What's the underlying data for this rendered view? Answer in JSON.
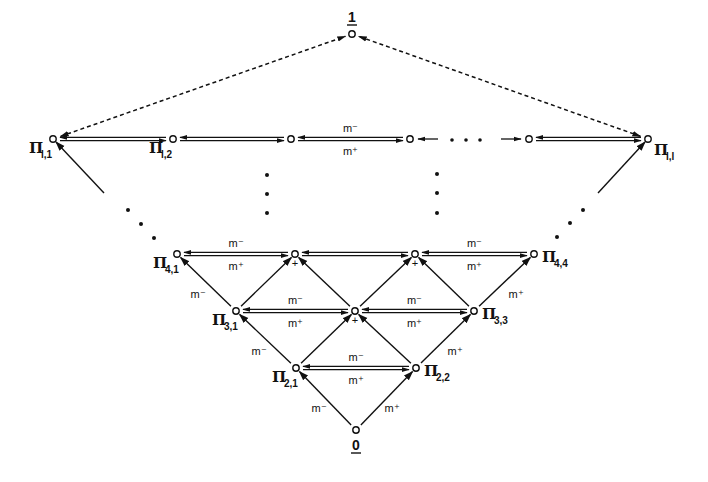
{
  "diagram": {
    "type": "lattice",
    "colors": {
      "ink": "#111111",
      "background": "#ffffff"
    },
    "top_node": {
      "id": "one",
      "label": "1",
      "x": 352,
      "y": 34
    },
    "bottom_node": {
      "id": "zero",
      "label": "0",
      "x": 356,
      "y": 430
    },
    "rows": [
      {
        "name": "row-l",
        "y": 139,
        "nodes": [
          {
            "id": "pi-l-1",
            "x": 53,
            "label": "Π",
            "sub": "l,1",
            "label_pos": "below-left"
          },
          {
            "id": "pi-l-2",
            "x": 173,
            "label": "Π",
            "sub": "l,2",
            "label_pos": "below-left"
          },
          {
            "id": "pi-l-3",
            "x": 291,
            "label": "",
            "sub": ""
          },
          {
            "id": "pi-l-4",
            "x": 410,
            "label": "",
            "sub": ""
          },
          {
            "id": "pi-l-5",
            "x": 529,
            "label": "",
            "sub": ""
          },
          {
            "id": "pi-l-l",
            "x": 648,
            "label": "Π",
            "sub": "l,l",
            "label_pos": "below-right"
          }
        ]
      },
      {
        "name": "row-4",
        "y": 254,
        "nodes": [
          {
            "id": "pi-4-1",
            "x": 177,
            "label": "Π",
            "sub": "4,1",
            "label_pos": "below-left"
          },
          {
            "id": "pi-4-2",
            "x": 295,
            "label": "",
            "sub": "",
            "plus": true
          },
          {
            "id": "pi-4-3",
            "x": 415,
            "label": "",
            "sub": "",
            "plus": true
          },
          {
            "id": "pi-4-4",
            "x": 534,
            "label": "Π",
            "sub": "4,4",
            "label_pos": "right"
          }
        ]
      },
      {
        "name": "row-3",
        "y": 311,
        "nodes": [
          {
            "id": "pi-3-1",
            "x": 236,
            "label": "Π",
            "sub": "3,1",
            "label_pos": "below-left"
          },
          {
            "id": "pi-3-2",
            "x": 355,
            "label": "",
            "sub": "",
            "plus": true
          },
          {
            "id": "pi-3-3",
            "x": 474,
            "label": "Π",
            "sub": "3,3",
            "label_pos": "right"
          }
        ]
      },
      {
        "name": "row-2",
        "y": 368,
        "nodes": [
          {
            "id": "pi-2-1",
            "x": 296,
            "label": "Π",
            "sub": "2,1",
            "label_pos": "below-left"
          },
          {
            "id": "pi-2-2",
            "x": 416,
            "label": "Π",
            "sub": "2,2",
            "label_pos": "right"
          }
        ]
      }
    ],
    "edge_labels": {
      "minus": "m⁻",
      "plus": "m⁺"
    },
    "horizontal_double_edges": [
      {
        "from": "pi-l-1",
        "to": "pi-l-2",
        "labels": false
      },
      {
        "from": "pi-l-2",
        "to": "pi-l-3",
        "labels": false
      },
      {
        "from": "pi-l-3",
        "to": "pi-l-4",
        "labels": true
      },
      {
        "from": "pi-l-5",
        "to": "pi-l-l",
        "labels": false
      },
      {
        "from": "pi-4-1",
        "to": "pi-4-2",
        "labels": true
      },
      {
        "from": "pi-4-2",
        "to": "pi-4-3",
        "labels": false
      },
      {
        "from": "pi-4-3",
        "to": "pi-4-4",
        "labels": true
      },
      {
        "from": "pi-3-1",
        "to": "pi-3-2",
        "labels": true
      },
      {
        "from": "pi-3-2",
        "to": "pi-3-3",
        "labels": true
      },
      {
        "from": "pi-2-1",
        "to": "pi-2-2",
        "labels": true
      }
    ],
    "ellipsis_row": {
      "y": 139,
      "from_x": 410,
      "to_x": 529,
      "text": "· · ·"
    },
    "diagonal_edges": [
      {
        "from": "zero",
        "to": "pi-2-1",
        "label": "m⁻",
        "label_x": 319,
        "label_y": 412
      },
      {
        "from": "zero",
        "to": "pi-2-2",
        "label": "m⁺",
        "label_x": 392,
        "label_y": 412
      },
      {
        "from": "pi-2-1",
        "to": "pi-3-1",
        "label": "m⁻",
        "label_x": 259,
        "label_y": 355
      },
      {
        "from": "pi-2-1",
        "to": "pi-3-2",
        "label": ""
      },
      {
        "from": "pi-2-2",
        "to": "pi-3-2",
        "label": ""
      },
      {
        "from": "pi-2-2",
        "to": "pi-3-3",
        "label": "m⁺",
        "label_x": 455,
        "label_y": 355
      },
      {
        "from": "pi-3-1",
        "to": "pi-4-1",
        "label": "m⁻",
        "label_x": 198,
        "label_y": 298
      },
      {
        "from": "pi-3-1",
        "to": "pi-4-2",
        "label": ""
      },
      {
        "from": "pi-3-2",
        "to": "pi-4-2",
        "label": ""
      },
      {
        "from": "pi-3-2",
        "to": "pi-4-3",
        "label": ""
      },
      {
        "from": "pi-3-3",
        "to": "pi-4-3",
        "label": ""
      },
      {
        "from": "pi-3-3",
        "to": "pi-4-4",
        "label": "m⁺",
        "label_x": 516,
        "label_y": 298
      }
    ],
    "dashed_edges": [
      {
        "from": "pi-l-1",
        "to": "one"
      },
      {
        "from": "pi-l-l",
        "to": "one"
      }
    ],
    "continuation_dots": [
      {
        "name": "left-diagonal",
        "points": [
          [
            128,
            210
          ],
          [
            141,
            224
          ],
          [
            154,
            238
          ]
        ]
      },
      {
        "name": "right-diagonal",
        "points": [
          [
            557,
            237
          ],
          [
            570,
            223
          ],
          [
            583,
            210
          ]
        ]
      },
      {
        "name": "mid-left-vertical",
        "points": [
          [
            267,
            175
          ],
          [
            267,
            194
          ],
          [
            267,
            213
          ]
        ]
      },
      {
        "name": "mid-right-vertical",
        "points": [
          [
            437,
            174
          ],
          [
            437,
            193
          ],
          [
            437,
            213
          ]
        ]
      }
    ],
    "edge_stubs": [
      {
        "name": "left-outer-edge",
        "x1": 104,
        "y1": 193,
        "x2": 56,
        "y2": 142,
        "arrow": true
      },
      {
        "name": "right-outer-edge",
        "x1": 598,
        "y1": 193,
        "x2": 645,
        "y2": 142,
        "arrow": true
      }
    ]
  }
}
